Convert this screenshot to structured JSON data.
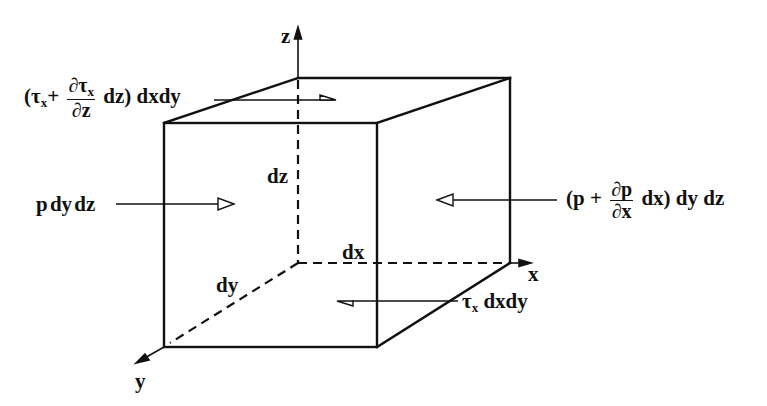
{
  "diagram": {
    "type": "fluid-element-force-balance",
    "axes": {
      "x": "x",
      "y": "y",
      "z": "z"
    },
    "dimensions": {
      "dx": "dx",
      "dy": "dy",
      "dz": "dz"
    },
    "forces": {
      "left_pressure": "p dy dz",
      "right_pressure": {
        "prefix": "(p + ",
        "frac_num": "∂p",
        "frac_den": "∂x",
        "suffix": " dx) dy dz"
      },
      "top_shear": {
        "prefix": "(τ",
        "prefix_sub": "x",
        "plus": "+ ",
        "frac_num": "∂τ",
        "frac_num_sub": "x",
        "frac_den": "∂z",
        "suffix": " dz) dxdy"
      },
      "bottom_shear": {
        "symbol": "τ",
        "symbol_sub": "x",
        "suffix": " dxdy"
      }
    },
    "colors": {
      "line": "#111111",
      "background": "#ffffff"
    }
  }
}
